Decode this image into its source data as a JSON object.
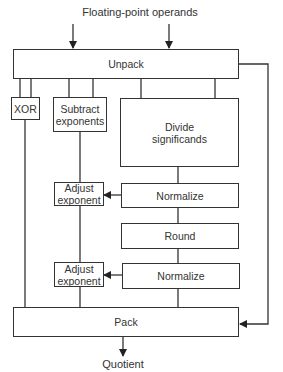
{
  "diagram": {
    "input_label": "Floating-point operands",
    "output_label": "Quotient",
    "blocks": {
      "unpack": "Unpack",
      "xor": "XOR",
      "subtract_exponents_1": "Subtract",
      "subtract_exponents_2": "exponents",
      "divide_1": "Divide",
      "divide_2": "significands",
      "adjust_exponent_a_1": "Adjust",
      "adjust_exponent_a_2": "exponent",
      "normalize_a": "Normalize",
      "round": "Round",
      "adjust_exponent_b_1": "Adjust",
      "adjust_exponent_b_2": "exponent",
      "normalize_b": "Normalize",
      "pack": "Pack"
    },
    "colors": {
      "stroke": "#333333",
      "background": "#ffffff"
    }
  }
}
